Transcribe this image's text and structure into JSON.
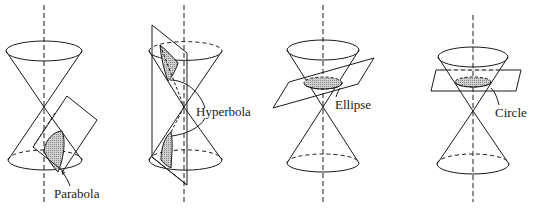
{
  "figure": {
    "colors": {
      "stroke": "#1a1a1a",
      "shade": "#bdbdbd",
      "background": "#ffffff"
    },
    "panels": [
      {
        "id": "parabola",
        "label": "Parabola"
      },
      {
        "id": "hyperbola",
        "label": "Hyperbola"
      },
      {
        "id": "ellipse",
        "label": "Ellipse"
      },
      {
        "id": "circle",
        "label": "Circle"
      }
    ]
  }
}
